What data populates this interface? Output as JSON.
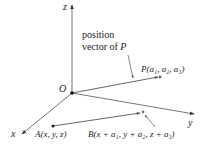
{
  "diagram": {
    "axes": {
      "x_label": "x",
      "y_label": "y",
      "z_label": "z",
      "origin_label": "O"
    },
    "annotation": {
      "line1": "position",
      "line2_prefix": "vector of ",
      "line2_var": "P"
    },
    "points": {
      "P": {
        "name": "P",
        "coords": "(a₁, a₂, a₃)"
      },
      "A": {
        "name": "A",
        "coords": "(x, y, z)"
      },
      "B": {
        "name": "B",
        "coords": "(x + a₁, y + a₂, z + a₃)"
      }
    },
    "colors": {
      "line": "#555555",
      "text": "#222222"
    }
  }
}
